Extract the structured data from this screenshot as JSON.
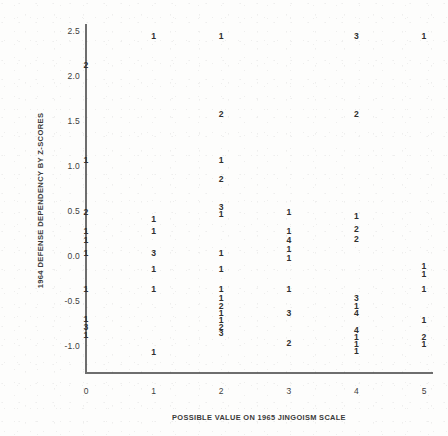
{
  "chart_data": {
    "type": "scatter",
    "title": "",
    "subtitle": "",
    "xlabel": "POSSIBLE VALUE ON 1965 JINGOISM SCALE",
    "ylabel": "1964 DEFENSE DEPENDENCY BY Z-SCORES",
    "xlim": [
      -0.35,
      5.35
    ],
    "ylim": [
      -1.32,
      2.72
    ],
    "xticks": [
      "0",
      "1",
      "2",
      "3",
      "4",
      "5"
    ],
    "xtick_values": [
      0,
      1,
      2,
      3,
      4,
      5
    ],
    "yticks": [
      "2.5",
      "2.0",
      "1.5",
      "1.0",
      "0.5",
      "0.0",
      "-0.5",
      "-1.0"
    ],
    "ytick_values": [
      2.5,
      2.0,
      1.5,
      1.0,
      0.5,
      0.0,
      -0.5,
      -1.0
    ],
    "grid": false,
    "legend": null,
    "marker_style": "numeric-count-label",
    "note": "Each plotted glyph is a digit giving the number of overlapping cases at that coordinate.",
    "points": [
      {
        "x": 1,
        "y": 2.45,
        "count": "1"
      },
      {
        "x": 2,
        "y": 2.45,
        "count": "1"
      },
      {
        "x": 4,
        "y": 2.45,
        "count": "3"
      },
      {
        "x": 5,
        "y": 2.45,
        "count": "1"
      },
      {
        "x": 0,
        "y": 2.12,
        "count": "2"
      },
      {
        "x": 2,
        "y": 1.58,
        "count": "2"
      },
      {
        "x": 4,
        "y": 1.58,
        "count": "2"
      },
      {
        "x": 0,
        "y": 1.07,
        "count": "1"
      },
      {
        "x": 2,
        "y": 1.07,
        "count": "1"
      },
      {
        "x": 2,
        "y": 0.86,
        "count": "2"
      },
      {
        "x": 2,
        "y": 0.55,
        "count": "3"
      },
      {
        "x": 0,
        "y": 0.49,
        "count": "2"
      },
      {
        "x": 1,
        "y": 0.41,
        "count": "1"
      },
      {
        "x": 2,
        "y": 0.47,
        "count": "1"
      },
      {
        "x": 3,
        "y": 0.49,
        "count": "1"
      },
      {
        "x": 4,
        "y": 0.44,
        "count": "1"
      },
      {
        "x": 0,
        "y": 0.28,
        "count": "1"
      },
      {
        "x": 1,
        "y": 0.28,
        "count": "1"
      },
      {
        "x": 3,
        "y": 0.28,
        "count": "1"
      },
      {
        "x": 4,
        "y": 0.3,
        "count": "2"
      },
      {
        "x": 0,
        "y": 0.18,
        "count": "1"
      },
      {
        "x": 3,
        "y": 0.18,
        "count": "4"
      },
      {
        "x": 4,
        "y": 0.19,
        "count": "2"
      },
      {
        "x": 3,
        "y": 0.08,
        "count": "1"
      },
      {
        "x": 0,
        "y": 0.03,
        "count": "1"
      },
      {
        "x": 1,
        "y": 0.03,
        "count": "3"
      },
      {
        "x": 2,
        "y": 0.03,
        "count": "1"
      },
      {
        "x": 3,
        "y": -0.02,
        "count": "1"
      },
      {
        "x": 5,
        "y": -0.11,
        "count": "1"
      },
      {
        "x": 5,
        "y": -0.2,
        "count": "1"
      },
      {
        "x": 1,
        "y": -0.14,
        "count": "1"
      },
      {
        "x": 2,
        "y": -0.14,
        "count": "1"
      },
      {
        "x": 0,
        "y": -0.37,
        "count": "1"
      },
      {
        "x": 1,
        "y": -0.37,
        "count": "1"
      },
      {
        "x": 2,
        "y": -0.37,
        "count": "1"
      },
      {
        "x": 3,
        "y": -0.37,
        "count": "1"
      },
      {
        "x": 5,
        "y": -0.37,
        "count": "1"
      },
      {
        "x": 2,
        "y": -0.47,
        "count": "1"
      },
      {
        "x": 4,
        "y": -0.47,
        "count": "3"
      },
      {
        "x": 2,
        "y": -0.55,
        "count": "2"
      },
      {
        "x": 4,
        "y": -0.55,
        "count": "1"
      },
      {
        "x": 2,
        "y": -0.63,
        "count": "1"
      },
      {
        "x": 3,
        "y": -0.63,
        "count": "3"
      },
      {
        "x": 4,
        "y": -0.63,
        "count": "4"
      },
      {
        "x": 0,
        "y": -0.7,
        "count": "1"
      },
      {
        "x": 2,
        "y": -0.71,
        "count": "1"
      },
      {
        "x": 5,
        "y": -0.71,
        "count": "1"
      },
      {
        "x": 0,
        "y": -0.79,
        "count": "3"
      },
      {
        "x": 2,
        "y": -0.79,
        "count": "2"
      },
      {
        "x": 2,
        "y": -0.86,
        "count": "3"
      },
      {
        "x": 4,
        "y": -0.82,
        "count": "4"
      },
      {
        "x": 0,
        "y": -0.88,
        "count": "1"
      },
      {
        "x": 4,
        "y": -0.9,
        "count": "1"
      },
      {
        "x": 5,
        "y": -0.9,
        "count": "2"
      },
      {
        "x": 3,
        "y": -0.97,
        "count": "2"
      },
      {
        "x": 4,
        "y": -0.98,
        "count": "1"
      },
      {
        "x": 5,
        "y": -0.98,
        "count": "1"
      },
      {
        "x": 1,
        "y": -1.07,
        "count": "1"
      },
      {
        "x": 4,
        "y": -1.06,
        "count": "1"
      }
    ]
  },
  "axis_colors": {
    "axis": "#6e6e6e",
    "text": "#3a3a3a",
    "marker": "#2f2f2f",
    "background": "#fdfdfc"
  }
}
